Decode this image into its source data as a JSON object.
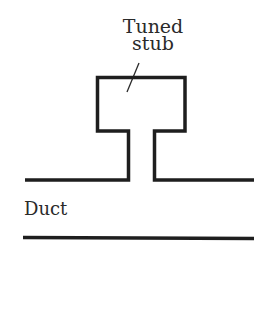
{
  "diagram": {
    "title_label": {
      "line1": "Tuned",
      "line2": "stub"
    },
    "duct_label": "Duct",
    "colors": {
      "stroke": "#1e1e1e",
      "text": "#2a2a2a",
      "background": "#ffffff"
    },
    "components": [
      {
        "name": "tuned-stub",
        "description": "Rectangular resonator cavity connected by a narrow neck"
      },
      {
        "name": "duct",
        "description": "Two parallel horizontal walls"
      }
    ]
  }
}
